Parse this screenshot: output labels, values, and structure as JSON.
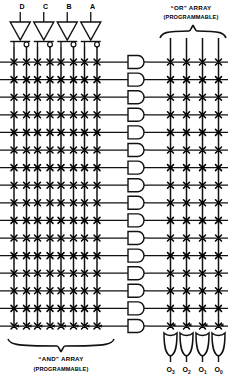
{
  "diagram": {
    "type": "pla-programmable-logic-array",
    "title_present": false,
    "colors": {
      "line": "#1a1a1a",
      "fuse": "#000000",
      "background": "#ffffff"
    }
  },
  "inputs": {
    "labels": [
      "D",
      "C",
      "B",
      "A"
    ],
    "count": 4,
    "label_x": [
      22,
      45.5,
      69,
      92.5
    ],
    "label_y": 8,
    "inverter_name": "inverter-buffer-with-bubble",
    "lines_per_input": 2,
    "line_kinds": [
      "true",
      "complement"
    ]
  },
  "and_array": {
    "name": "AND array",
    "title": "“AND” ARRAY",
    "subtitle": "(PROGRAMMABLE)",
    "title_x": 61,
    "title_y": 361,
    "subtitle_y": 371,
    "brace_left": 8,
    "brace_right": 114,
    "brace_y": 346,
    "vertical_lines": 8,
    "vline_x": [
      14,
      26.5,
      37.5,
      50,
      61,
      73.5,
      84.5,
      97
    ],
    "vline_top": 44,
    "vline_bottom": 331,
    "product_terms": 16,
    "gate_name": "and-gate",
    "gate_label": "AND"
  },
  "or_array": {
    "name": "OR array",
    "title": "“OR” ARRAY",
    "subtitle": "(PROGRAMMABLE)",
    "title_x": 191,
    "title_y": 10,
    "subtitle_y": 19,
    "brace_left": 160,
    "brace_right": 226,
    "brace_y": 31,
    "vertical_lines": 4,
    "vline_x": [
      170.5,
      186.5,
      202.5,
      218.5
    ],
    "vline_top": 38,
    "vline_bottom": 330,
    "gate_name": "or-gate",
    "gate_label": "OR"
  },
  "product_rows": {
    "count": 16,
    "y_start": 62,
    "y_step": 17.6,
    "line_left": 0,
    "line_right": 228
  },
  "outputs": {
    "count": 4,
    "labels": [
      "O",
      "O",
      "O",
      "O"
    ],
    "subscripts": [
      "3",
      "2",
      "1",
      "0"
    ],
    "x": [
      170.5,
      186.5,
      202.5,
      218.5
    ],
    "label_y": 372
  },
  "fuses": {
    "glyph": "x-crosspoint",
    "and_array_note": "fuse mark at every vertical-input / product-line crossing",
    "or_array_note": "fuse mark at every product-line / output-line crossing"
  }
}
